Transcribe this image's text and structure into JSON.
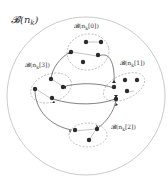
{
  "diagram": {
    "outer_label": "𝓑(n",
    "outer_label_sub": "k",
    "outer_label_close": ")",
    "colors": {
      "outer_circle": "#b5b5b5",
      "cluster_outline": "#9a9a9a",
      "edge": "#4a4a4a",
      "node": "#2b2b2b",
      "label": "#333333"
    },
    "clusters": [
      {
        "id": "0",
        "label": "𝓑(n",
        "sub": "k",
        "index": "[0])",
        "full_label": "B(n_k[0])"
      },
      {
        "id": "1",
        "label": "𝓑(n",
        "sub": "k",
        "index": "[1])",
        "full_label": "B(n_k[1])"
      },
      {
        "id": "2",
        "label": "𝓑(n",
        "sub": "k",
        "index": "[2])",
        "full_label": "B(n_k[2])"
      },
      {
        "id": "3",
        "label": "𝓑(n",
        "sub": "k",
        "index": "[3])",
        "full_label": "B(n_k[3])"
      }
    ]
  }
}
